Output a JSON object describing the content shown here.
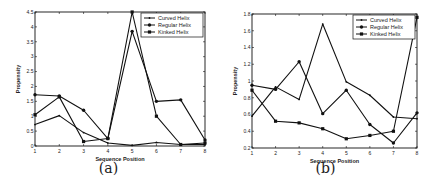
{
  "chart_data": [
    {
      "type": "line",
      "panel": "a",
      "caption": "(a)",
      "title": "",
      "xlabel": "Sequence Position",
      "ylabel": "Propensity",
      "x": [
        1,
        2,
        3,
        4,
        5,
        6,
        7,
        8
      ],
      "xticks": [
        "1",
        "2",
        "3",
        "4",
        "5",
        "6",
        "7",
        "8"
      ],
      "yticks": [
        "0",
        "0.5",
        "1",
        "1.5",
        "2",
        "2.5",
        "3",
        "3.5",
        "4",
        "4.5"
      ],
      "ylim": [
        0,
        4.5
      ],
      "xlim": [
        1,
        8
      ],
      "grid": false,
      "legend_position": "upper right",
      "series": [
        {
          "name": "Curved Helix",
          "marker": "dot",
          "values": [
            0.72,
            1.02,
            0.45,
            0.1,
            0.02,
            0.12,
            0.05,
            0.05
          ]
        },
        {
          "name": "Regular Helix",
          "marker": "circle",
          "values": [
            1.72,
            1.68,
            1.2,
            0.25,
            3.85,
            1.5,
            1.55,
            0.2
          ]
        },
        {
          "name": "Kinked Helix",
          "marker": "square",
          "values": [
            1.05,
            1.65,
            0.15,
            0.25,
            4.5,
            1.0,
            0.05,
            0.1
          ]
        }
      ]
    },
    {
      "type": "line",
      "panel": "b",
      "caption": "(b)",
      "title": "",
      "xlabel": "Sequence Position",
      "ylabel": "Propensity",
      "x": [
        1,
        2,
        3,
        4,
        5,
        6,
        7,
        8
      ],
      "xticks": [
        "1",
        "2",
        "3",
        "4",
        "5",
        "6",
        "7",
        "8"
      ],
      "yticks": [
        "0.2",
        "0.4",
        "0.6",
        "0.8",
        "1",
        "1.2",
        "1.4",
        "1.6",
        "1.8"
      ],
      "ylim": [
        0.2,
        1.8
      ],
      "xlim": [
        1,
        8
      ],
      "grid": false,
      "legend_position": "upper right",
      "series": [
        {
          "name": "Curved Helix",
          "marker": "dot",
          "values": [
            0.58,
            0.93,
            0.78,
            1.68,
            0.99,
            0.83,
            0.57,
            0.55
          ]
        },
        {
          "name": "Regular Helix",
          "marker": "circle",
          "values": [
            0.95,
            0.9,
            1.23,
            0.61,
            0.89,
            0.48,
            0.26,
            0.62
          ]
        },
        {
          "name": "Kinked Helix",
          "marker": "square",
          "values": [
            0.89,
            0.52,
            0.5,
            0.43,
            0.31,
            0.35,
            0.4,
            1.76
          ]
        }
      ]
    }
  ]
}
